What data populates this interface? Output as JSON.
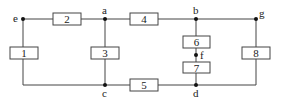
{
  "diagram": {
    "type": "circuit-graph",
    "nodes": [
      {
        "id": "e",
        "label": "e"
      },
      {
        "id": "a",
        "label": "a"
      },
      {
        "id": "b",
        "label": "b"
      },
      {
        "id": "g",
        "label": "g"
      },
      {
        "id": "c",
        "label": "c"
      },
      {
        "id": "d",
        "label": "d"
      },
      {
        "id": "f",
        "label": "f"
      }
    ],
    "elements": [
      {
        "id": "1",
        "label": "1",
        "from": "e",
        "to": "c"
      },
      {
        "id": "2",
        "label": "2",
        "from": "e",
        "to": "a"
      },
      {
        "id": "3",
        "label": "3",
        "from": "a",
        "to": "c"
      },
      {
        "id": "4",
        "label": "4",
        "from": "a",
        "to": "b"
      },
      {
        "id": "5",
        "label": "5",
        "from": "c",
        "to": "d"
      },
      {
        "id": "6",
        "label": "6",
        "from": "b",
        "to": "f"
      },
      {
        "id": "7",
        "label": "7",
        "from": "f",
        "to": "d"
      },
      {
        "id": "8",
        "label": "8",
        "from": "g",
        "to": "d"
      }
    ]
  }
}
